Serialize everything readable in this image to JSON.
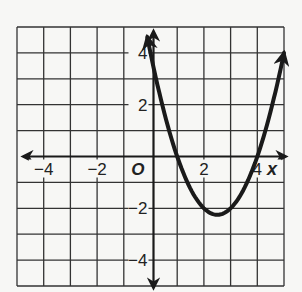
{
  "chart_data": {
    "type": "line",
    "title": "",
    "xlabel": "x",
    "ylabel": "",
    "origin_label": "O",
    "xlim": [
      -5,
      5
    ],
    "ylim": [
      -5,
      5
    ],
    "grid": true,
    "grid_step": 1,
    "x_ticks": [
      {
        "value": -4,
        "label": "−4"
      },
      {
        "value": -2,
        "label": "−2"
      },
      {
        "value": 2,
        "label": "2"
      },
      {
        "value": 4,
        "label": "4"
      }
    ],
    "y_ticks": [
      {
        "value": 4,
        "label": "4"
      },
      {
        "value": 2,
        "label": "2"
      },
      {
        "value": -2,
        "label": "−2"
      },
      {
        "value": -4,
        "label": "−4"
      }
    ],
    "series": [
      {
        "name": "parabola",
        "equation": "y = x^2 - 5x + 4",
        "arrows_both_ends": true,
        "x": [
          -0.12,
          0,
          0.5,
          1,
          1.5,
          2,
          2.5,
          3,
          3.5,
          4,
          4.5,
          5
        ],
        "values": [
          4.63,
          4,
          1.75,
          0,
          -1.25,
          -2,
          -2.25,
          -2,
          -1.25,
          0,
          1.75,
          4
        ]
      }
    ],
    "key_points": {
      "y_intercept": [
        0,
        4
      ],
      "x_intercepts": [
        [
          1,
          0
        ],
        [
          4,
          0
        ]
      ],
      "vertex": [
        2.5,
        -2.25
      ]
    },
    "colors": {
      "curve": "#1a1a1a",
      "grid": "#333333",
      "background": "#f7f7f5"
    }
  }
}
